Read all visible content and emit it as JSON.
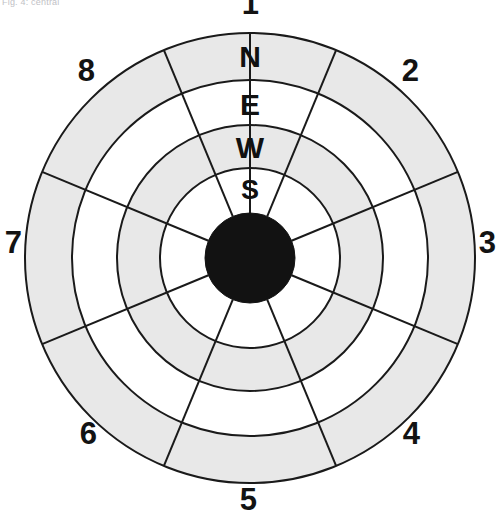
{
  "caption": {
    "text": "Fig. 4: central"
  },
  "diagram": {
    "center": {
      "x": 250,
      "y": 258
    },
    "outer_radius": 225,
    "colors": {
      "ring_shaded": "#e8e8e8",
      "ring_plain": "#ffffff",
      "hub": "#121212",
      "stroke": "#1a1a1a",
      "background": "#ffffff",
      "label": "#131313"
    },
    "stroke_width": 2,
    "spoke_count": 8,
    "spoke_offset_deg": 22.5,
    "rings": [
      {
        "name": "ring-outer",
        "label": "N",
        "inner_r": 178,
        "outer_r": 225,
        "fill": "shaded"
      },
      {
        "name": "ring-second",
        "label": "E",
        "inner_r": 133,
        "outer_r": 178,
        "fill": "plain"
      },
      {
        "name": "ring-third",
        "label": "W",
        "inner_r": 90,
        "outer_r": 133,
        "fill": "shaded"
      },
      {
        "name": "ring-inner",
        "label": "S",
        "inner_r": 45,
        "outer_r": 90,
        "fill": "plain"
      },
      {
        "name": "hub",
        "label": "",
        "inner_r": 0,
        "outer_r": 45,
        "fill": "hub"
      }
    ],
    "ring_labels": [
      {
        "letter": "N",
        "x": 250,
        "y": 57
      },
      {
        "letter": "E",
        "x": 250,
        "y": 105
      },
      {
        "letter": "W",
        "x": 250,
        "y": 148
      },
      {
        "letter": "S",
        "x": 250,
        "y": 192
      }
    ],
    "index_labels": [
      {
        "value": "1",
        "x": 250,
        "y": 4,
        "angle_deg": 0
      },
      {
        "value": "2",
        "x": 410,
        "y": 71,
        "angle_deg": 45
      },
      {
        "value": "3",
        "x": 487,
        "y": 243,
        "angle_deg": 90
      },
      {
        "value": "4",
        "x": 411,
        "y": 434,
        "angle_deg": 135
      },
      {
        "value": "5",
        "x": 248,
        "y": 500,
        "angle_deg": 180
      },
      {
        "value": "6",
        "x": 88,
        "y": 434,
        "angle_deg": 225
      },
      {
        "value": "7",
        "x": 13,
        "y": 243,
        "angle_deg": 270
      },
      {
        "value": "8",
        "x": 86,
        "y": 71,
        "angle_deg": 315
      }
    ]
  }
}
